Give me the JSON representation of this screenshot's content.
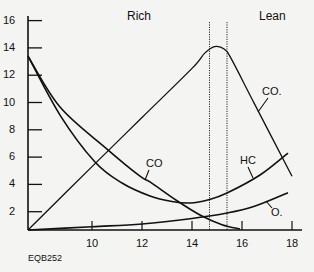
{
  "chart_data": {
    "type": "line",
    "title": "",
    "xlabel": "",
    "ylabel": "",
    "xlim": [
      7.44,
      18.4
    ],
    "ylim": [
      0.66,
      16.5
    ],
    "grid": false,
    "legend_position": "inline-labels",
    "x_ticks": [
      10,
      12,
      14,
      16,
      18
    ],
    "y_ticks": [
      2,
      4,
      6,
      8,
      10,
      12,
      14,
      16
    ],
    "regions": [
      {
        "label": "Rich",
        "side": "left of stoichiometric band"
      },
      {
        "label": "Lean",
        "side": "right of stoichiometric band"
      }
    ],
    "reference_lines": [
      {
        "x": 14.7,
        "style": "dotted"
      },
      {
        "x": 15.4,
        "style": "dotted"
      }
    ],
    "series": [
      {
        "name": "CO2",
        "display_label": "CO.",
        "points": [
          [
            7.44,
            0.66
          ],
          [
            10,
            5.3
          ],
          [
            12,
            8.9
          ],
          [
            14,
            12.5
          ],
          [
            14.5,
            13.6
          ],
          [
            14.9,
            14.1
          ],
          [
            15.3,
            13.9
          ],
          [
            15.6,
            13.1
          ],
          [
            16.5,
            9.9
          ],
          [
            18,
            4.6
          ]
        ]
      },
      {
        "name": "HC",
        "display_label": "HC",
        "points": [
          [
            7.44,
            13.4
          ],
          [
            8.72,
            9.08
          ],
          [
            10.12,
            5.64
          ],
          [
            11.2,
            4.1
          ],
          [
            12.32,
            3.15
          ],
          [
            13.2,
            2.75
          ],
          [
            13.92,
            2.64
          ],
          [
            14.7,
            2.9
          ],
          [
            15.4,
            3.37
          ],
          [
            16.72,
            4.69
          ],
          [
            17.84,
            6.3
          ]
        ]
      },
      {
        "name": "CO",
        "display_label": "CO",
        "points": [
          [
            7.44,
            13.4
          ],
          [
            8.72,
            9.67
          ],
          [
            10.6,
            6.59
          ],
          [
            11.92,
            4.6
          ],
          [
            12.32,
            4.18
          ],
          [
            13.4,
            2.8
          ],
          [
            14.32,
            1.76
          ],
          [
            15.2,
            1.05
          ],
          [
            15.92,
            0.73
          ]
        ]
      },
      {
        "name": "O2",
        "display_label": "O.",
        "points": [
          [
            7.44,
            0.66
          ],
          [
            10,
            0.9
          ],
          [
            12,
            1.1
          ],
          [
            14,
            1.5
          ],
          [
            15.4,
            1.9
          ],
          [
            16.5,
            2.4
          ],
          [
            17.84,
            3.39
          ]
        ]
      }
    ],
    "annotations": [
      "Rich",
      "Lean",
      "EQB252"
    ]
  },
  "labels": {
    "rich": "Rich",
    "lean": "Lean",
    "co2": "CO.",
    "hc": "HC",
    "co": "CO",
    "o2": "O.",
    "figure_code": "EQB252"
  },
  "colors": {
    "background": "#f4f4f2",
    "ink": "#111111"
  }
}
